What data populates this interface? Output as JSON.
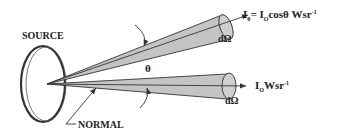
{
  "diagram": {
    "labels": {
      "source": "SOURCE",
      "normal": "NORMAL",
      "theta": "θ",
      "d_omega_top": "dΩ",
      "d_omega_bottom": "dΩ",
      "intensity_angled": {
        "lhs_I": "I",
        "lhs_sub": "θ",
        "equals": "= ",
        "rhs_I": "I",
        "rhs_sub": "O",
        "rhs_rest": "cosθ Wsr",
        "rhs_sup": "-1"
      },
      "intensity_normal": {
        "I": "I",
        "sub": "O",
        "rest": "Wsr",
        "sup": "-1"
      }
    },
    "colors": {
      "cone_fill": "#c4c4c4",
      "stroke": "#333333",
      "text": "#222222",
      "background": "#ffffff"
    }
  }
}
